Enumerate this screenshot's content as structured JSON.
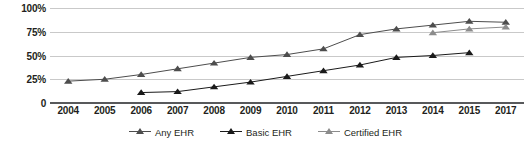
{
  "chart_data": {
    "type": "line",
    "title": "",
    "xlabel": "",
    "ylabel": "",
    "categories": [
      "2004",
      "2005",
      "2006",
      "2007",
      "2008",
      "2009",
      "2010",
      "2011",
      "2012",
      "2013",
      "2014",
      "2015",
      "2017"
    ],
    "ylim": [
      0,
      100
    ],
    "ytick_labels": [
      "0",
      "25%",
      "50%",
      "75%",
      "100%"
    ],
    "ytick_values": [
      0,
      25,
      50,
      75,
      100
    ],
    "grid": true,
    "legend_position": "bottom",
    "series": [
      {
        "name": "Any EHR",
        "color": "#4d4d4d",
        "values": [
          23,
          25,
          30,
          36,
          42,
          48,
          51,
          57,
          72,
          78,
          82,
          86,
          85
        ]
      },
      {
        "name": "Basic EHR",
        "color": "#1a1a1a",
        "values": [
          null,
          null,
          11,
          12,
          17,
          22,
          28,
          34,
          40,
          48,
          50,
          53,
          null
        ]
      },
      {
        "name": "Certified EHR",
        "color": "#8c8c8c",
        "values": [
          null,
          null,
          null,
          null,
          null,
          null,
          null,
          null,
          null,
          null,
          74,
          78,
          80
        ]
      }
    ]
  },
  "colors": {
    "gridline": "#c9c9c9",
    "axis": "#58595b",
    "text": "#231f20",
    "any_ehr": "#4d4d4d",
    "basic_ehr": "#1a1a1a",
    "certified_ehr": "#8c8c8c"
  }
}
